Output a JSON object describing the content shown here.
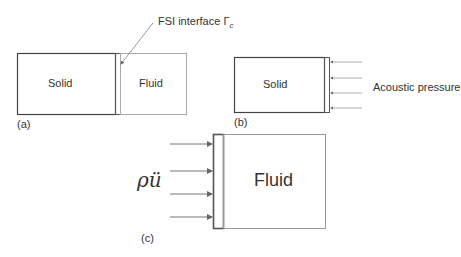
{
  "panel_a": {
    "caption": "(a)",
    "solid_label": "Solid",
    "fluid_label": "Fluid",
    "interface_label": "FSI interface Γ",
    "interface_subscript": "c"
  },
  "panel_b": {
    "caption": "(b)",
    "solid_label": "Solid",
    "load_label": "Acoustic pressure"
  },
  "panel_c": {
    "caption": "(c)",
    "fluid_label": "Fluid",
    "load_label": "ρü"
  }
}
